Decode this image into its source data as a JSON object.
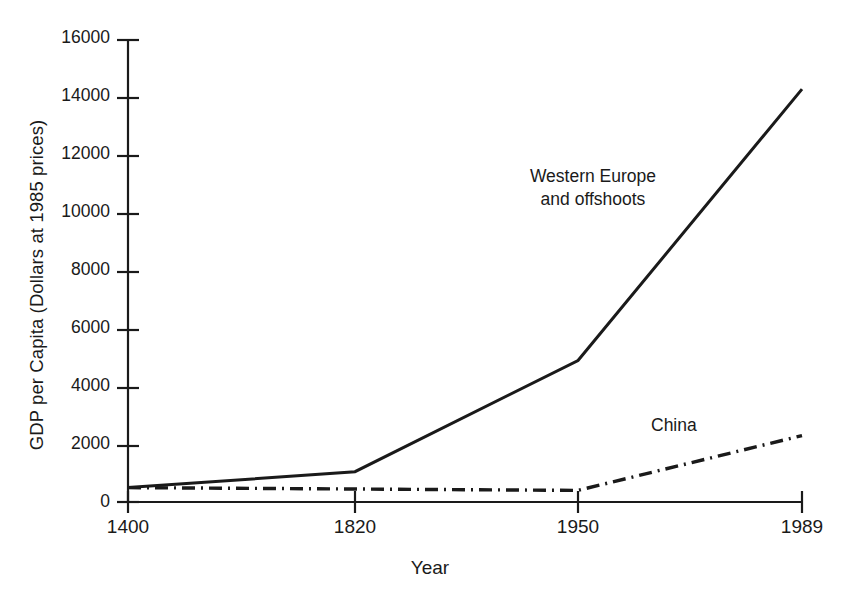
{
  "chart_data": {
    "type": "line",
    "title": "",
    "xlabel": "Year",
    "ylabel": "GDP per Capita (Dollars at 1985 prices)",
    "categories": [
      "1400",
      "1820",
      "1950",
      "1989"
    ],
    "xtick_labels": [
      "1400",
      "1820",
      "1950",
      "1989"
    ],
    "ytick_labels": [
      "0",
      "2000",
      "4000",
      "6000",
      "8000",
      "10000",
      "12000",
      "14000",
      "16000"
    ],
    "ytick_values": [
      0,
      2000,
      4000,
      6000,
      8000,
      10000,
      12000,
      14000,
      16000
    ],
    "ylim": [
      0,
      16000
    ],
    "grid": false,
    "legend_position": "inline-annotations",
    "series": [
      {
        "name": "Western Europe and offshoots",
        "label_line1": "Western Europe",
        "label_line2": "and offshoots",
        "linestyle": "solid",
        "color": "#1a1a1a",
        "values": [
          500,
          1050,
          4900,
          14300
        ]
      },
      {
        "name": "China",
        "label_line1": "China",
        "label_line2": "",
        "linestyle": "dash-dot",
        "color": "#1a1a1a",
        "values": [
          500,
          450,
          400,
          2300
        ]
      }
    ]
  },
  "axis": {
    "y_title": "GDP per Capita (Dollars at 1985 prices)",
    "x_title": "Year"
  }
}
